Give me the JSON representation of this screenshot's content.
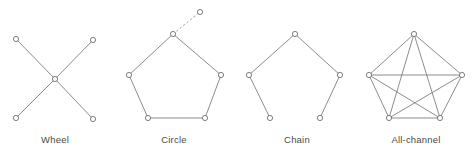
{
  "figure": {
    "background_color": "#ffffff",
    "edge_color": "#6e6e6e",
    "node_stroke_color": "#5e5e5e",
    "node_fill_color": "#ffffff",
    "label_color": "#4a4a4a",
    "node_radius": 2.6,
    "width": 473,
    "height": 154
  },
  "diagrams": [
    {
      "id": "wheel",
      "label": "Wheel",
      "label_x": 55,
      "label_y": 143,
      "nodes": [
        {
          "name": "top-left",
          "x": 16,
          "y": 39
        },
        {
          "name": "top-right",
          "x": 93,
          "y": 40
        },
        {
          "name": "center",
          "x": 55,
          "y": 79
        },
        {
          "name": "bottom-left",
          "x": 16,
          "y": 118
        },
        {
          "name": "bottom-right",
          "x": 93,
          "y": 119
        }
      ],
      "edges": [
        {
          "from": 0,
          "to": 2,
          "style": "solid"
        },
        {
          "from": 1,
          "to": 2,
          "style": "solid"
        },
        {
          "from": 3,
          "to": 2,
          "style": "solid"
        },
        {
          "from": 4,
          "to": 2,
          "style": "solid"
        }
      ]
    },
    {
      "id": "circle",
      "label": "Circle",
      "label_x": 174,
      "label_y": 143,
      "nodes": [
        {
          "name": "top",
          "x": 173,
          "y": 34
        },
        {
          "name": "right",
          "x": 221,
          "y": 75
        },
        {
          "name": "bottom-right",
          "x": 205,
          "y": 118
        },
        {
          "name": "bottom-left",
          "x": 148,
          "y": 118
        },
        {
          "name": "left",
          "x": 129,
          "y": 75
        },
        {
          "name": "detached",
          "x": 200,
          "y": 12
        }
      ],
      "edges": [
        {
          "from": 0,
          "to": 1,
          "style": "solid"
        },
        {
          "from": 1,
          "to": 2,
          "style": "solid"
        },
        {
          "from": 2,
          "to": 3,
          "style": "solid"
        },
        {
          "from": 3,
          "to": 4,
          "style": "solid"
        },
        {
          "from": 4,
          "to": 0,
          "style": "solid"
        },
        {
          "from": 0,
          "to": 5,
          "style": "dashed"
        }
      ]
    },
    {
      "id": "chain",
      "label": "Chain",
      "label_x": 297,
      "label_y": 143,
      "nodes": [
        {
          "name": "top",
          "x": 295,
          "y": 34
        },
        {
          "name": "right",
          "x": 340,
          "y": 75
        },
        {
          "name": "bottom-right",
          "x": 320,
          "y": 118
        },
        {
          "name": "bottom-left",
          "x": 270,
          "y": 118
        },
        {
          "name": "left",
          "x": 249,
          "y": 75
        }
      ],
      "edges": [
        {
          "from": 0,
          "to": 1,
          "style": "solid"
        },
        {
          "from": 1,
          "to": 2,
          "style": "solid"
        },
        {
          "from": 3,
          "to": 4,
          "style": "solid"
        },
        {
          "from": 4,
          "to": 0,
          "style": "solid"
        }
      ]
    },
    {
      "id": "all-channel",
      "label": "All-channel",
      "label_x": 416,
      "label_y": 143,
      "nodes": [
        {
          "name": "top",
          "x": 414,
          "y": 34
        },
        {
          "name": "right",
          "x": 462,
          "y": 75
        },
        {
          "name": "bottom-right",
          "x": 440,
          "y": 118
        },
        {
          "name": "bottom-left",
          "x": 389,
          "y": 118
        },
        {
          "name": "left",
          "x": 369,
          "y": 75
        }
      ],
      "edges": [
        {
          "from": 0,
          "to": 1,
          "style": "solid"
        },
        {
          "from": 1,
          "to": 2,
          "style": "solid"
        },
        {
          "from": 2,
          "to": 3,
          "style": "solid"
        },
        {
          "from": 3,
          "to": 4,
          "style": "solid"
        },
        {
          "from": 4,
          "to": 0,
          "style": "solid"
        },
        {
          "from": 0,
          "to": 2,
          "style": "solid"
        },
        {
          "from": 0,
          "to": 3,
          "style": "solid"
        },
        {
          "from": 1,
          "to": 3,
          "style": "solid"
        },
        {
          "from": 1,
          "to": 4,
          "style": "solid"
        },
        {
          "from": 2,
          "to": 4,
          "style": "solid"
        }
      ]
    }
  ]
}
